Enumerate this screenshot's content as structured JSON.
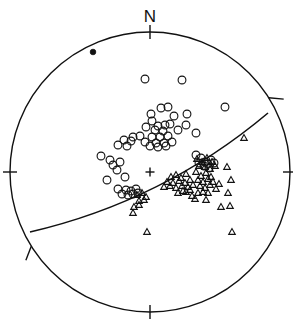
{
  "figure": {
    "type": "stereonet",
    "title": "",
    "north_label": "N",
    "projection": "lower-hemisphere equal-area stereographic projection",
    "background_color": "#ffffff",
    "line_color": "#111111",
    "marker_color": "#111111"
  },
  "chart_data": {
    "type": "scatter",
    "title": "",
    "xlabel": "",
    "ylabel": "",
    "projection": "stereonet",
    "grid": false,
    "legend_position": "none",
    "primitive_circle": {
      "center_x": 150,
      "center_y": 172,
      "radius": 140,
      "stroke_width": 1.4
    },
    "azimuth_ticks": [
      {
        "name": "north-tick",
        "azimuth_deg": 0,
        "label": "N",
        "style": "radial-outward-inward"
      },
      {
        "name": "east-tick",
        "azimuth_deg": 90,
        "label": "",
        "style": "radial"
      },
      {
        "name": "south-tick",
        "azimuth_deg": 180,
        "label": "",
        "style": "radial"
      },
      {
        "name": "west-tick",
        "azimuth_deg": 270,
        "label": "",
        "style": "radial"
      },
      {
        "name": "ne-oblique-tick",
        "azimuth_deg": 58,
        "label": "",
        "style": "oblique-outward"
      },
      {
        "name": "sw-oblique-tick",
        "azimuth_deg": 238,
        "label": "",
        "style": "oblique-inward"
      }
    ],
    "center_marker": {
      "name": "center-cross",
      "x": 150,
      "y": 172,
      "size": 9
    },
    "great_circle": {
      "name": "fault-plane-great-circle",
      "description": "great circle trace of a plane, dipping gently, trending WSW-ENE",
      "left_endpoint": [
        30,
        232
      ],
      "right_endpoint": [
        268,
        113
      ],
      "bulge": 16
    },
    "series": [
      {
        "name": "filled-dot",
        "marker": "filled-circle",
        "marker_size": 4,
        "count": 1,
        "points": [
          [
            93,
            52
          ]
        ]
      },
      {
        "name": "open-circles",
        "marker": "open-circle",
        "marker_size": 5,
        "count": 58,
        "points": [
          [
            145,
            79
          ],
          [
            182,
            80
          ],
          [
            161,
            108
          ],
          [
            168,
            107
          ],
          [
            225,
            107
          ],
          [
            151,
            114
          ],
          [
            152,
            121
          ],
          [
            174,
            116
          ],
          [
            187,
            114
          ],
          [
            158,
            126
          ],
          [
            165,
            125
          ],
          [
            170,
            124
          ],
          [
            186,
            125
          ],
          [
            146,
            127
          ],
          [
            155,
            130
          ],
          [
            163,
            131
          ],
          [
            178,
            130
          ],
          [
            196,
            133
          ],
          [
            133,
            137
          ],
          [
            140,
            136
          ],
          [
            152,
            137
          ],
          [
            160,
            137
          ],
          [
            168,
            136
          ],
          [
            124,
            140
          ],
          [
            131,
            141
          ],
          [
            145,
            142
          ],
          [
            156,
            143
          ],
          [
            164,
            143
          ],
          [
            172,
            142
          ],
          [
            118,
            145
          ],
          [
            127,
            146
          ],
          [
            150,
            146
          ],
          [
            158,
            147
          ],
          [
            166,
            146
          ],
          [
            101,
            156
          ],
          [
            110,
            160
          ],
          [
            113,
            165
          ],
          [
            120,
            162
          ],
          [
            117,
            170
          ],
          [
            107,
            180
          ],
          [
            125,
            177
          ],
          [
            118,
            189
          ],
          [
            126,
            190
          ],
          [
            131,
            191
          ],
          [
            136,
            189
          ],
          [
            122,
            194
          ],
          [
            128,
            195
          ],
          [
            133,
            194
          ],
          [
            138,
            193
          ],
          [
            196,
            155
          ],
          [
            201,
            158
          ],
          [
            205,
            162
          ],
          [
            199,
            163
          ],
          [
            204,
            166
          ],
          [
            208,
            164
          ],
          [
            211,
            160
          ],
          [
            214,
            163
          ],
          [
            209,
            168
          ]
        ]
      },
      {
        "name": "open-triangles",
        "marker": "open-triangle",
        "marker_size": 6,
        "count": 62,
        "points": [
          [
            244,
            138
          ],
          [
            197,
            159
          ],
          [
            202,
            162
          ],
          [
            207,
            158
          ],
          [
            212,
            162
          ],
          [
            199,
            166
          ],
          [
            205,
            167
          ],
          [
            210,
            169
          ],
          [
            215,
            166
          ],
          [
            171,
            177
          ],
          [
            176,
            175
          ],
          [
            181,
            178
          ],
          [
            186,
            174
          ],
          [
            167,
            182
          ],
          [
            173,
            183
          ],
          [
            179,
            181
          ],
          [
            185,
            183
          ],
          [
            190,
            180
          ],
          [
            164,
            187
          ],
          [
            170,
            186
          ],
          [
            176,
            188
          ],
          [
            182,
            186
          ],
          [
            188,
            187
          ],
          [
            196,
            172
          ],
          [
            201,
            176
          ],
          [
            206,
            173
          ],
          [
            211,
            177
          ],
          [
            198,
            180
          ],
          [
            203,
            182
          ],
          [
            208,
            179
          ],
          [
            213,
            182
          ],
          [
            200,
            186
          ],
          [
            205,
            188
          ],
          [
            210,
            185
          ],
          [
            203,
            192
          ],
          [
            208,
            193
          ],
          [
            227,
            167
          ],
          [
            231,
            180
          ],
          [
            228,
            193
          ],
          [
            195,
            199
          ],
          [
            206,
            200
          ],
          [
            221,
            207
          ],
          [
            230,
            206
          ],
          [
            137,
            195
          ],
          [
            142,
            193
          ],
          [
            146,
            197
          ],
          [
            139,
            201
          ],
          [
            144,
            200
          ],
          [
            134,
            207
          ],
          [
            139,
            205
          ],
          [
            133,
            213
          ],
          [
            147,
            232
          ],
          [
            232,
            232
          ],
          [
            190,
            190
          ],
          [
            193,
            185
          ],
          [
            186,
            192
          ],
          [
            178,
            193
          ],
          [
            183,
            191
          ],
          [
            216,
            189
          ],
          [
            219,
            184
          ],
          [
            192,
            196
          ],
          [
            198,
            193
          ]
        ]
      }
    ]
  }
}
